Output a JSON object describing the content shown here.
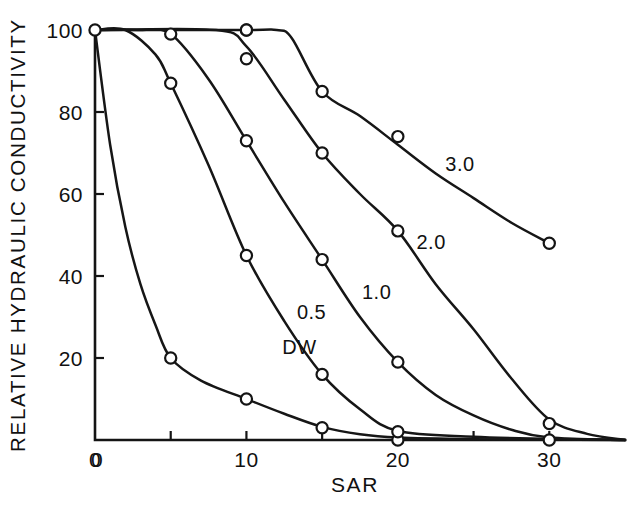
{
  "chart_data": {
    "type": "line",
    "title": "",
    "xlabel": "SAR",
    "ylabel": "RELATIVE HYDRAULIC CONDUCTIVITY",
    "xlim": [
      0,
      35
    ],
    "ylim": [
      0,
      100
    ],
    "xticks": [
      0,
      5,
      10,
      15,
      20,
      25,
      30
    ],
    "xtick_labels": [
      "0",
      "",
      "10",
      "",
      "20",
      "",
      "30"
    ],
    "yticks": [
      0,
      20,
      40,
      60,
      80,
      100
    ],
    "ytick_labels": [
      "",
      "20",
      "40",
      "60",
      "80",
      "100"
    ],
    "grid": false,
    "legend_position": "inline-labels",
    "marker": "open-circle",
    "series": [
      {
        "name": "DW",
        "label": "DW",
        "label_x": 13.5,
        "label_y": 21,
        "x": [
          0,
          5,
          10,
          15,
          20
        ],
        "y": [
          100,
          20,
          10,
          3,
          0
        ],
        "path_x": [
          0,
          1,
          2,
          3,
          4,
          5,
          7,
          10,
          12.5,
          15,
          17.5,
          20,
          25,
          30,
          35
        ],
        "path_y": [
          100,
          72,
          52,
          38,
          28,
          20,
          14.5,
          10,
          6.4,
          3.2,
          1.4,
          0.6,
          0.2,
          0.1,
          0
        ]
      },
      {
        "name": "0.5",
        "label": "0.5",
        "label_x": 14.3,
        "label_y": 29.5,
        "x": [
          5,
          10,
          15,
          20
        ],
        "y": [
          87,
          45,
          16,
          2
        ],
        "path_x": [
          0,
          2,
          4,
          5,
          7.5,
          10,
          12.5,
          15,
          17.5,
          20,
          25,
          30,
          35
        ],
        "path_y": [
          100,
          100,
          94,
          87,
          67,
          45,
          29,
          16,
          7.5,
          2.2,
          0.8,
          0.3,
          0
        ]
      },
      {
        "name": "1.0",
        "label": "1.0",
        "label_x": 18.6,
        "label_y": 34.5,
        "x": [
          5,
          10,
          15,
          20,
          30
        ],
        "y": [
          99,
          73,
          44,
          19,
          0
        ],
        "path_x": [
          0,
          3,
          5,
          7.5,
          10,
          12.5,
          15,
          17.5,
          20,
          22.5,
          25,
          27.5,
          30,
          35
        ],
        "path_y": [
          100,
          100,
          99,
          88,
          73,
          58,
          44,
          30,
          19,
          11,
          6,
          2.5,
          0.6,
          0
        ]
      },
      {
        "name": "2.0",
        "label": "2.0",
        "label_x": 22.2,
        "label_y": 46.5,
        "x": [
          10,
          10,
          15,
          20,
          30
        ],
        "y": [
          100,
          93,
          70,
          51,
          4
        ],
        "path_x": [
          0,
          8,
          10,
          12.5,
          15,
          17.5,
          20,
          22.5,
          25,
          27.5,
          30,
          32.5,
          35
        ],
        "path_y": [
          100,
          100,
          96,
          83,
          70,
          60,
          51,
          38,
          27,
          15,
          5,
          1.5,
          0
        ]
      },
      {
        "name": "3.0",
        "label": "3.0",
        "label_x": 24.1,
        "label_y": 65.5,
        "x": [
          10,
          15,
          20,
          30
        ],
        "y": [
          100,
          85,
          74,
          48
        ],
        "path_x": [
          0,
          10,
          12,
          13,
          15,
          17.5,
          20,
          22.5,
          25,
          27.5,
          30
        ],
        "path_y": [
          100,
          100,
          100,
          98,
          85,
          79,
          72,
          65,
          59,
          53,
          48
        ]
      }
    ]
  },
  "plot": {
    "left_px": 95,
    "right_px": 625,
    "top_px": 30,
    "bottom_px": 440
  }
}
